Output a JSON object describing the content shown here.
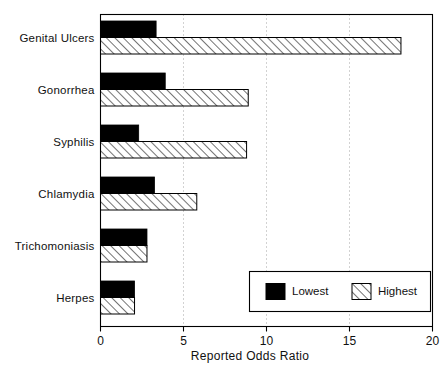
{
  "chart_data": {
    "type": "bar",
    "orientation": "horizontal",
    "title": "",
    "xlabel": "Reported Odds Ratio",
    "ylabel": "",
    "xlim": [
      0,
      20
    ],
    "ylim": null,
    "grid": "vertical-dotted",
    "xticks": [
      0,
      5,
      10,
      15,
      20
    ],
    "xticklabels": [
      "0",
      "5",
      "10",
      "15",
      "20"
    ],
    "categories": [
      "Genital Ulcers",
      "Gonorrhea",
      "Syphilis",
      "Chlamydia",
      "Trichomoniasis",
      "Herpes"
    ],
    "series": [
      {
        "name": "Lowest",
        "fill": "solid-black",
        "color": "#000000",
        "values": [
          3.35,
          3.9,
          2.3,
          3.25,
          2.8,
          2.05
        ]
      },
      {
        "name": "Highest",
        "fill": "diagonal-hatch",
        "color": "#ffffff",
        "values": [
          18.1,
          8.9,
          8.8,
          5.8,
          2.8,
          2.05
        ]
      }
    ],
    "legend": {
      "position": "bottom-right",
      "entries": [
        {
          "label": "Lowest",
          "fill": "solid-black"
        },
        {
          "label": "Highest",
          "fill": "diagonal-hatch"
        }
      ]
    }
  },
  "colors": {
    "axis": "#000000",
    "grid": "#9a9a9a",
    "lowest": "#000000",
    "highest": "#ffffff",
    "hatch": "#000000",
    "background": "#ffffff"
  }
}
